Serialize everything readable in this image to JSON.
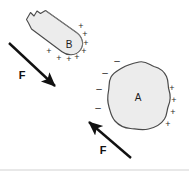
{
  "figure": {
    "background_color": "#ffffff",
    "stroke_color": "#4a4a4a",
    "fill_color": "#ececec",
    "arrow_color": "#111111"
  },
  "objects": {
    "bar": {
      "label": "B",
      "label_x": 69,
      "label_y": 45,
      "description": "rounded elongated bar tilted down-right with a notch at upper-left end"
    },
    "blob": {
      "label": "A",
      "label_x": 138,
      "label_y": 98,
      "description": "irregular lumpy closed blob"
    }
  },
  "charges": {
    "bar_positive": [
      {
        "sign": "+",
        "x": 81,
        "y": 27
      },
      {
        "sign": "+",
        "x": 85,
        "y": 35
      },
      {
        "sign": "+",
        "x": 86,
        "y": 44
      },
      {
        "sign": "+",
        "x": 84,
        "y": 52
      },
      {
        "sign": "+",
        "x": 49,
        "y": 52
      },
      {
        "sign": "+",
        "x": 59,
        "y": 59
      },
      {
        "sign": "+",
        "x": 69,
        "y": 60
      },
      {
        "sign": "+",
        "x": 77,
        "y": 58
      }
    ],
    "blob_negative": [
      {
        "sign": "–",
        "x": 117,
        "y": 61
      },
      {
        "sign": "–",
        "x": 105,
        "y": 73
      },
      {
        "sign": "–",
        "x": 99,
        "y": 89
      },
      {
        "sign": "–",
        "x": 98,
        "y": 108
      }
    ],
    "blob_positive": [
      {
        "sign": "+",
        "x": 172,
        "y": 89
      },
      {
        "sign": "+",
        "x": 174,
        "y": 101
      },
      {
        "sign": "+",
        "x": 173,
        "y": 113
      },
      {
        "sign": "+",
        "x": 168,
        "y": 125
      }
    ]
  },
  "forces": [
    {
      "name": "force-on-bar",
      "label": "F",
      "label_x": 22,
      "label_y": 76,
      "x1": 9,
      "y1": 43,
      "x2": 57,
      "y2": 88,
      "direction": "down-right"
    },
    {
      "name": "force-on-blob",
      "label": "F",
      "label_x": 103,
      "label_y": 151,
      "x1": 131,
      "y1": 158,
      "x2": 87,
      "y2": 120,
      "direction": "up-left"
    }
  ]
}
